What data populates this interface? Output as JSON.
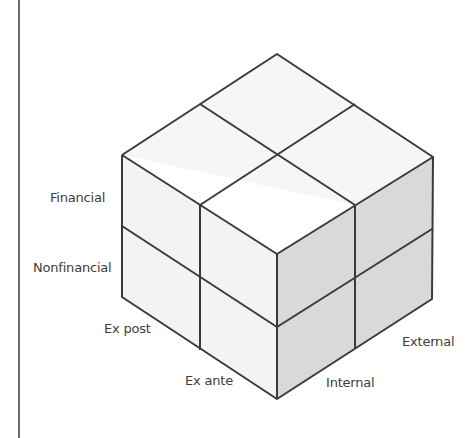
{
  "diagram": {
    "type": "3d-cube-framework",
    "dimensions": {
      "vertical_axis": [
        "Financial",
        "Nonfinancial"
      ],
      "left_depth_axis": [
        "Ex post",
        "Ex ante"
      ],
      "right_depth_axis": [
        "Internal",
        "External"
      ]
    },
    "labels": {
      "financial": "Financial",
      "nonfinancial": "Nonfinancial",
      "ex_post": "Ex post",
      "ex_ante": "Ex ante",
      "internal": "Internal",
      "external": "External"
    },
    "colors": {
      "top_face": "#f6f6f6",
      "left_face": "#f4f4f4",
      "right_face": "#d9d9d9",
      "edges": "#3a3a3a",
      "label_text": "#3d3d3d",
      "rule": "#6e6e6e"
    }
  }
}
